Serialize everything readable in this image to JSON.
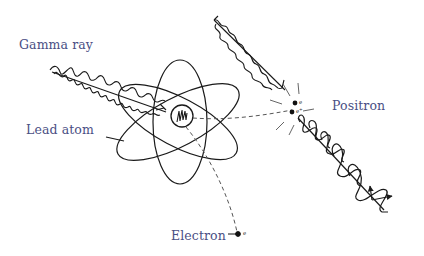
{
  "diagram": {
    "colors": {
      "label": "#4a4f84",
      "line": "#1a1a1a",
      "dashed": "#555555",
      "background": "#ffffff"
    },
    "labels": {
      "gamma_ray": "Gamma ray",
      "lead_atom": "Lead atom",
      "positron": "Positron",
      "electron": "Electron"
    },
    "particle_symbols": {
      "positron_1": "e",
      "positron_2": "e⁺",
      "electron": "e"
    },
    "nodes": [
      {
        "id": "incoming-gamma-ray",
        "kind": "wave",
        "from": [
          48,
          70
        ],
        "to": [
          166,
          113
        ]
      },
      {
        "id": "lead-atom",
        "kind": "atom",
        "center": [
          180,
          118
        ]
      },
      {
        "id": "nucleus",
        "kind": "circle",
        "center": [
          182,
          116
        ],
        "r": 11
      },
      {
        "id": "outgoing-gamma-ray-upper",
        "kind": "wave",
        "from": [
          214,
          18
        ],
        "to": [
          288,
          90
        ]
      },
      {
        "id": "outgoing-gamma-ray-lower",
        "kind": "wave",
        "from": [
          296,
          118
        ],
        "to": [
          388,
          212
        ]
      },
      {
        "id": "positron",
        "kind": "particle",
        "at": [
          293,
          110
        ]
      },
      {
        "id": "electron",
        "kind": "particle",
        "at": [
          238,
          233
        ]
      }
    ],
    "edges": [
      {
        "from": "nucleus",
        "to": "positron",
        "style": "dashed"
      },
      {
        "from": "nucleus",
        "to": "electron",
        "style": "dashed"
      }
    ]
  }
}
